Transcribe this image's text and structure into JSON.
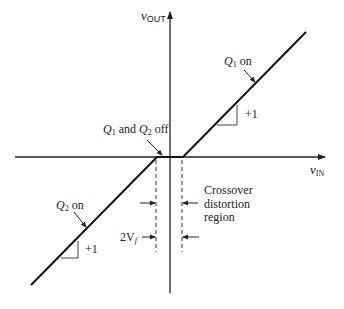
{
  "diagram": {
    "type": "transfer-characteristic",
    "axes": {
      "y_label": {
        "main": "v",
        "sub": "OUT"
      },
      "x_label": {
        "main": "v",
        "sub": "IN"
      }
    },
    "annotations": {
      "q1_on": {
        "q": "Q",
        "sub": "1",
        "text": " on"
      },
      "q2_on": {
        "q": "Q",
        "sub": "2",
        "text": " on"
      },
      "both_off": {
        "q1": "Q",
        "sub1": "1",
        "and": " and ",
        "q2": "Q",
        "sub2": "2",
        "text": " off"
      },
      "slope_upper": "+1",
      "slope_lower": "+1",
      "crossover_line1": "Crossover",
      "crossover_line2": "distortion",
      "crossover_line3": "region",
      "width_label": {
        "main": "2V",
        "sub": "f"
      }
    }
  }
}
